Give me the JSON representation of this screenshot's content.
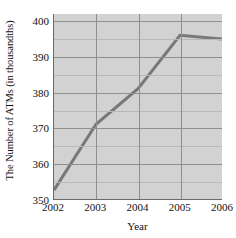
{
  "chart_data": {
    "type": "line",
    "title": "",
    "xlabel": "Year",
    "ylabel": "The Number of ATMs (in thousandths)",
    "x": [
      2002,
      2003,
      2004,
      2005,
      2006
    ],
    "xtick_labels": [
      "2002",
      "2003",
      "2004",
      "2005",
      "2006"
    ],
    "values": [
      352.5,
      371,
      381,
      396,
      395
    ],
    "series": [
      {
        "name": "The Number of ATMs (in thousandths)",
        "values": [
          352.5,
          371,
          381,
          396,
          395
        ]
      }
    ],
    "ytick_labels": [
      "350",
      "360",
      "370",
      "380",
      "390",
      "400"
    ],
    "yticks": [
      350,
      360,
      370,
      380,
      390,
      400
    ],
    "minor_yticks": [
      355,
      365,
      375,
      385,
      395
    ],
    "ylim": [
      350,
      402
    ],
    "xlim": [
      2002,
      2006
    ],
    "grid": true,
    "minor_grid": true,
    "legend": "none",
    "colors": {
      "line": "#787878",
      "plot_background": "#d2d2d2",
      "gridline": "#8f8f8f",
      "minor_gridline": "#b9b9b9",
      "axis": "#6a6a6a",
      "text": "#111111",
      "page_background": "#ffffff"
    },
    "line_width": 3
  }
}
